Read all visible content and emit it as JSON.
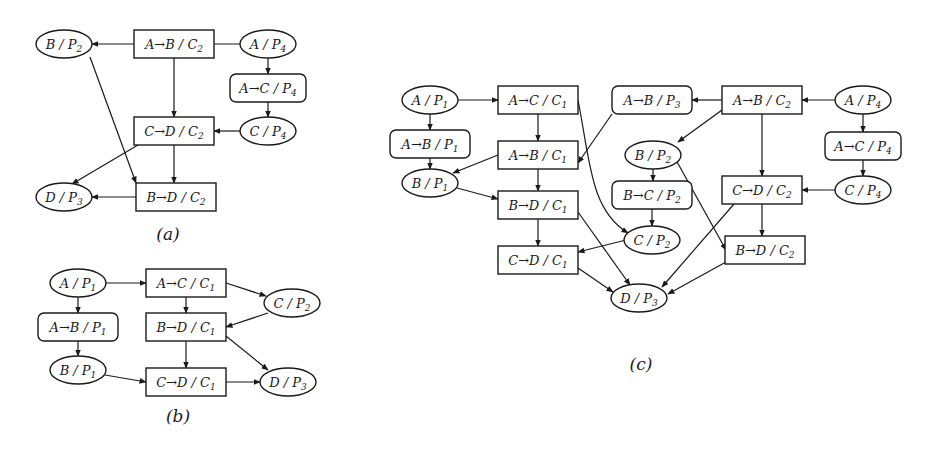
{
  "figures": [
    {
      "id": "a",
      "caption": "(a)",
      "caption_pos": [
        168,
        240
      ],
      "nodes": [
        {
          "id": "BP2",
          "shape": "ellipse",
          "label": "B / P",
          "sub": "2",
          "x": 64,
          "y": 44,
          "w": 56,
          "h": 28
        },
        {
          "id": "ABC2",
          "shape": "rect",
          "label": "A→B / C",
          "sub": "2",
          "x": 174,
          "y": 44,
          "w": 80,
          "h": 28
        },
        {
          "id": "AP4",
          "shape": "ellipse",
          "label": "A / P",
          "sub": "4",
          "x": 268,
          "y": 44,
          "w": 56,
          "h": 28
        },
        {
          "id": "ACP4",
          "shape": "round",
          "label": "A→C / P",
          "sub": "4",
          "x": 268,
          "y": 88,
          "w": 76,
          "h": 28
        },
        {
          "id": "CDC2",
          "shape": "rect",
          "label": "C→D / C",
          "sub": "2",
          "x": 174,
          "y": 131,
          "w": 80,
          "h": 28
        },
        {
          "id": "CP4",
          "shape": "ellipse",
          "label": "C / P",
          "sub": "4",
          "x": 268,
          "y": 131,
          "w": 56,
          "h": 28
        },
        {
          "id": "DP3",
          "shape": "ellipse",
          "label": "D / P",
          "sub": "3",
          "x": 64,
          "y": 197,
          "w": 56,
          "h": 28
        },
        {
          "id": "BDC2",
          "shape": "rect",
          "label": "B→D / C",
          "sub": "2",
          "x": 176,
          "y": 197,
          "w": 80,
          "h": 28
        }
      ],
      "edges": [
        {
          "from": [
            240,
            44
          ],
          "to": [
            202,
            44
          ]
        },
        {
          "from": [
            146,
            44
          ],
          "to": [
            92,
            44
          ]
        },
        {
          "from": [
            268,
            58
          ],
          "to": [
            268,
            74
          ]
        },
        {
          "from": [
            268,
            102
          ],
          "to": [
            268,
            117
          ]
        },
        {
          "from": [
            240,
            131
          ],
          "to": [
            214,
            131
          ]
        },
        {
          "from": [
            174,
            58
          ],
          "to": [
            174,
            117
          ]
        },
        {
          "from": [
            174,
            145
          ],
          "to": [
            174,
            183
          ]
        },
        {
          "from": [
            90,
            57
          ],
          "to": [
            136,
            183
          ]
        },
        {
          "from": [
            138,
            145
          ],
          "to": [
            72,
            184
          ]
        },
        {
          "from": [
            136,
            197
          ],
          "to": [
            92,
            197
          ]
        }
      ]
    },
    {
      "id": "b",
      "caption": "(b)",
      "caption_pos": [
        178,
        422
      ],
      "nodes": [
        {
          "id": "AP1",
          "shape": "ellipse",
          "label": "A / P",
          "sub": "1",
          "x": 78,
          "y": 283,
          "w": 56,
          "h": 28
        },
        {
          "id": "ACC1",
          "shape": "rect",
          "label": "A→C / C",
          "sub": "1",
          "x": 186,
          "y": 283,
          "w": 80,
          "h": 28
        },
        {
          "id": "CP2",
          "shape": "ellipse",
          "label": "C / P",
          "sub": "2",
          "x": 292,
          "y": 303,
          "w": 56,
          "h": 28
        },
        {
          "id": "ABP1",
          "shape": "round",
          "label": "A→B / P",
          "sub": "1",
          "x": 78,
          "y": 327,
          "w": 80,
          "h": 28
        },
        {
          "id": "BDC1",
          "shape": "rect",
          "label": "B→D / C",
          "sub": "1",
          "x": 186,
          "y": 327,
          "w": 80,
          "h": 28
        },
        {
          "id": "BP1",
          "shape": "ellipse",
          "label": "B / P",
          "sub": "1",
          "x": 78,
          "y": 370,
          "w": 56,
          "h": 28
        },
        {
          "id": "CDC1",
          "shape": "rect",
          "label": "C→D / C",
          "sub": "1",
          "x": 186,
          "y": 382,
          "w": 80,
          "h": 28
        },
        {
          "id": "DP3",
          "shape": "ellipse",
          "label": "D / P",
          "sub": "3",
          "x": 288,
          "y": 382,
          "w": 56,
          "h": 28
        }
      ],
      "edges": [
        {
          "from": [
            106,
            283
          ],
          "to": [
            146,
            283
          ]
        },
        {
          "from": [
            78,
            297
          ],
          "to": [
            78,
            313
          ]
        },
        {
          "from": [
            78,
            341
          ],
          "to": [
            78,
            356
          ]
        },
        {
          "from": [
            226,
            283
          ],
          "to": [
            266,
            296
          ]
        },
        {
          "from": [
            268,
            313
          ],
          "to": [
            226,
            327
          ]
        },
        {
          "from": [
            186,
            297
          ],
          "to": [
            186,
            313
          ]
        },
        {
          "from": [
            186,
            341
          ],
          "to": [
            186,
            368
          ]
        },
        {
          "from": [
            226,
            336
          ],
          "to": [
            268,
            370
          ]
        },
        {
          "from": [
            105,
            375
          ],
          "to": [
            146,
            382
          ]
        },
        {
          "from": [
            226,
            382
          ],
          "to": [
            260,
            382
          ]
        }
      ]
    },
    {
      "id": "c",
      "caption": "(c)",
      "caption_pos": [
        641,
        370
      ],
      "nodes": [
        {
          "id": "AP1",
          "shape": "ellipse",
          "label": "A / P",
          "sub": "1",
          "x": 430,
          "y": 100,
          "w": 56,
          "h": 28
        },
        {
          "id": "ACC1",
          "shape": "rect",
          "label": "A→C / C",
          "sub": "1",
          "x": 538,
          "y": 100,
          "w": 80,
          "h": 28
        },
        {
          "id": "ABP3",
          "shape": "round",
          "label": "A→B / P",
          "sub": "3",
          "x": 652,
          "y": 100,
          "w": 80,
          "h": 28
        },
        {
          "id": "ABC2",
          "shape": "rect",
          "label": "A→B / C",
          "sub": "2",
          "x": 762,
          "y": 100,
          "w": 80,
          "h": 28
        },
        {
          "id": "AP4",
          "shape": "ellipse",
          "label": "A / P",
          "sub": "4",
          "x": 863,
          "y": 100,
          "w": 56,
          "h": 28
        },
        {
          "id": "ABP1",
          "shape": "round",
          "label": "A→B / P",
          "sub": "1",
          "x": 430,
          "y": 144,
          "w": 80,
          "h": 28
        },
        {
          "id": "ABC1",
          "shape": "rect",
          "label": "A→B / C",
          "sub": "1",
          "x": 538,
          "y": 155,
          "w": 80,
          "h": 28
        },
        {
          "id": "ACP4",
          "shape": "round",
          "label": "A→C / P",
          "sub": "4",
          "x": 863,
          "y": 146,
          "w": 76,
          "h": 28
        },
        {
          "id": "BP2",
          "shape": "ellipse",
          "label": "B / P",
          "sub": "2",
          "x": 653,
          "y": 155,
          "w": 56,
          "h": 28
        },
        {
          "id": "BP1",
          "shape": "ellipse",
          "label": "B / P",
          "sub": "1",
          "x": 430,
          "y": 183,
          "w": 56,
          "h": 28
        },
        {
          "id": "CDC2",
          "shape": "rect",
          "label": "C→D / C",
          "sub": "2",
          "x": 762,
          "y": 190,
          "w": 80,
          "h": 28
        },
        {
          "id": "CP4",
          "shape": "ellipse",
          "label": "C / P",
          "sub": "4",
          "x": 863,
          "y": 190,
          "w": 56,
          "h": 28
        },
        {
          "id": "BCP2",
          "shape": "round",
          "label": "B→C / P",
          "sub": "2",
          "x": 652,
          "y": 195,
          "w": 80,
          "h": 28
        },
        {
          "id": "BDC1",
          "shape": "rect",
          "label": "B→D / C",
          "sub": "1",
          "x": 538,
          "y": 205,
          "w": 80,
          "h": 28
        },
        {
          "id": "CP2",
          "shape": "ellipse",
          "label": "C / P",
          "sub": "2",
          "x": 652,
          "y": 240,
          "w": 56,
          "h": 28
        },
        {
          "id": "BDC2",
          "shape": "rect",
          "label": "B→D / C",
          "sub": "2",
          "x": 765,
          "y": 250,
          "w": 80,
          "h": 28
        },
        {
          "id": "CDC1",
          "shape": "rect",
          "label": "C→D / C",
          "sub": "1",
          "x": 538,
          "y": 260,
          "w": 80,
          "h": 28
        },
        {
          "id": "DP3",
          "shape": "ellipse",
          "label": "D / P",
          "sub": "3",
          "x": 639,
          "y": 298,
          "w": 56,
          "h": 28
        }
      ],
      "edges": [
        {
          "from": [
            458,
            100
          ],
          "to": [
            498,
            100
          ]
        },
        {
          "from": [
            430,
            114
          ],
          "to": [
            430,
            130
          ]
        },
        {
          "from": [
            430,
            158
          ],
          "to": [
            430,
            169
          ]
        },
        {
          "from": [
            538,
            114
          ],
          "to": [
            538,
            141
          ]
        },
        {
          "from": [
            538,
            169
          ],
          "to": [
            538,
            191
          ]
        },
        {
          "from": [
            538,
            219
          ],
          "to": [
            538,
            246
          ]
        },
        {
          "from": [
            498,
            155
          ],
          "to": [
            453,
            173
          ]
        },
        {
          "from": [
            457,
            188
          ],
          "to": [
            498,
            199
          ]
        },
        {
          "from": [
            612,
            114
          ],
          "to": [
            578,
            163
          ]
        },
        {
          "from": [
            835,
            100
          ],
          "to": [
            802,
            100
          ]
        },
        {
          "from": [
            722,
            100
          ],
          "to": [
            692,
            100
          ]
        },
        {
          "from": [
            863,
            114
          ],
          "to": [
            863,
            132
          ]
        },
        {
          "from": [
            863,
            160
          ],
          "to": [
            863,
            176
          ]
        },
        {
          "from": [
            835,
            190
          ],
          "to": [
            802,
            190
          ]
        },
        {
          "from": [
            762,
            114
          ],
          "to": [
            762,
            176
          ]
        },
        {
          "from": [
            762,
            204
          ],
          "to": [
            762,
            236
          ]
        },
        {
          "from": [
            722,
            110
          ],
          "to": [
            678,
            142
          ]
        },
        {
          "from": [
            653,
            169
          ],
          "to": [
            653,
            181
          ]
        },
        {
          "from": [
            652,
            209
          ],
          "to": [
            652,
            226
          ]
        },
        {
          "from": [
            676,
            160
          ],
          "to": [
            726,
            250
          ]
        },
        {
          "from": [
            626,
            240
          ],
          "to": [
            578,
            252
          ]
        },
        {
          "from": [
            578,
            212
          ],
          "to": [
            630,
            285
          ]
        },
        {
          "from": [
            578,
            268
          ],
          "to": [
            613,
            292
          ]
        },
        {
          "from": [
            734,
            204
          ],
          "to": [
            662,
            287
          ]
        },
        {
          "from": [
            726,
            262
          ],
          "to": [
            668,
            294
          ]
        }
      ],
      "curves": [
        {
          "d": "M 578 100 C 590 160, 590 210, 628 233"
        }
      ]
    }
  ]
}
